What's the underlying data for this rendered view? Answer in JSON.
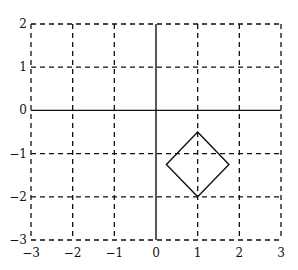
{
  "chart_data": {
    "type": "line",
    "title": "",
    "xlabel": "",
    "ylabel": "",
    "xlim": [
      -3,
      3
    ],
    "ylim": [
      -3,
      2
    ],
    "grid": true,
    "grid_style": "dashed",
    "x_ticks": [
      "-3",
      "-2",
      "-1",
      "0",
      "1",
      "2",
      "3"
    ],
    "y_ticks": [
      "-3",
      "-2",
      "-1",
      "0",
      "1",
      "2"
    ],
    "x_tick_values": [
      -3,
      -2,
      -1,
      0,
      1,
      2,
      3
    ],
    "y_tick_values": [
      -3,
      -2,
      -1,
      0,
      1,
      2
    ],
    "axes_lines": {
      "x_axis_at_y": 0,
      "y_axis_at_x": 0
    },
    "series": [
      {
        "name": "diamond",
        "closed": true,
        "color": "#111111",
        "points": [
          {
            "x": 1,
            "y": -0.5
          },
          {
            "x": 1.75,
            "y": -1.25
          },
          {
            "x": 1,
            "y": -2
          },
          {
            "x": 0.25,
            "y": -1.25
          }
        ]
      }
    ],
    "legend": null
  }
}
